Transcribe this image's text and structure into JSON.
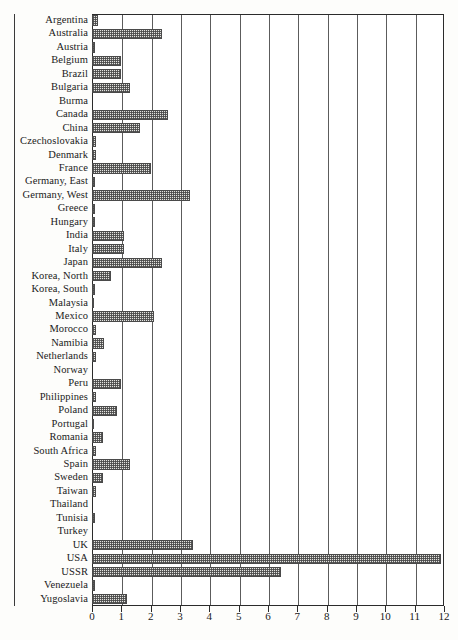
{
  "chart_data": {
    "type": "bar",
    "orientation": "horizontal",
    "title": "",
    "subtitle": "",
    "xlabel": "",
    "ylabel": "",
    "xlim": [
      0,
      12
    ],
    "ylim": null,
    "grid": true,
    "legend": null,
    "xticks": [
      0,
      1,
      2,
      3,
      4,
      5,
      6,
      7,
      8,
      9,
      10,
      11,
      12
    ],
    "xtick_labels": [
      "0",
      "1",
      "2",
      "3",
      "4",
      "5",
      "6",
      "7",
      "8",
      "9",
      "10",
      "11",
      "12"
    ],
    "categories": [
      "Argentina",
      "Australia",
      "Austria",
      "Belgium",
      "Brazil",
      "Bulgaria",
      "Burma",
      "Canada",
      "China",
      "Czechoslovakia",
      "Denmark",
      "France",
      "Germany, East",
      "Germany, West",
      "Greece",
      "Hungary",
      "India",
      "Italy",
      "Japan",
      "Korea, North",
      "Korea, South",
      "Malaysia",
      "Mexico",
      "Morocco",
      "Namibia",
      "Netherlands",
      "Norway",
      "Peru",
      "Philippines",
      "Poland",
      "Portugal",
      "Romania",
      "South Africa",
      "Spain",
      "Sweden",
      "Taiwan",
      "Thailand",
      "Tunisia",
      "Turkey",
      "UK",
      "USA",
      "USSR",
      "Venezuela",
      "Yugoslavia"
    ],
    "values": [
      0.2,
      2.4,
      0.1,
      1.0,
      1.0,
      1.3,
      0.0,
      2.6,
      1.65,
      0.15,
      0.15,
      2.0,
      0.1,
      3.35,
      0.1,
      0.1,
      1.1,
      1.1,
      2.4,
      0.65,
      0.1,
      0.05,
      2.1,
      0.15,
      0.4,
      0.15,
      0.0,
      1.0,
      0.15,
      0.85,
      0.05,
      0.38,
      0.15,
      1.3,
      0.37,
      0.15,
      0.0,
      0.1,
      0.0,
      3.45,
      11.9,
      6.45,
      0.1,
      1.2
    ]
  },
  "axis": {
    "x_min_label": "0",
    "x_max_label": "12"
  }
}
